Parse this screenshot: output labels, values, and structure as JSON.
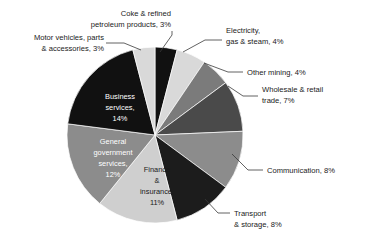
{
  "chart_data": {
    "type": "pie",
    "title": "",
    "subtitle": "",
    "xlabel": "",
    "ylabel": "",
    "legend_position": "none",
    "grid": false,
    "units": "percent",
    "start_angle_deg": 0,
    "direction": "clockwise",
    "categories": [
      "Coke & refined petroleum products",
      "Electricity, gas & steam",
      "Other mining",
      "Wholesale & retail trade",
      "Communication",
      "Transport & storage",
      "Finance & insurance",
      "General government services",
      "Business services",
      "Motor vehicles, parts & accessories"
    ],
    "values": [
      3,
      4,
      4,
      7,
      8,
      8,
      11,
      12,
      14,
      3
    ],
    "colors": [
      "#111111",
      "#d9d9d9",
      "#7b7b7b",
      "#4a4a4a",
      "#8c8c8c",
      "#1c1c1c",
      "#cfcfcf",
      "#8c8c8c",
      "#111111",
      "#d9d9d9"
    ],
    "slices": [
      {
        "name": "coke-refined-petroleum-products",
        "label_line_1": "Coke & refined",
        "label_line_2": "petroleum products, 3%",
        "value": 3,
        "percent_text": "3%",
        "color": "#111111",
        "label_placement": "outside"
      },
      {
        "name": "electricity-gas-steam",
        "label_line_1": "Electricity,",
        "label_line_2": "gas & steam, 4%",
        "value": 4,
        "percent_text": "4%",
        "color": "#d9d9d9",
        "label_placement": "outside"
      },
      {
        "name": "other-mining",
        "label_line_1": "Other mining, 4%",
        "label_line_2": "",
        "value": 4,
        "percent_text": "4%",
        "color": "#7b7b7b",
        "label_placement": "outside"
      },
      {
        "name": "wholesale-retail-trade",
        "label_line_1": "Wholesale & retail",
        "label_line_2": "trade, 7%",
        "value": 7,
        "percent_text": "7%",
        "color": "#4a4a4a",
        "label_placement": "outside"
      },
      {
        "name": "communication",
        "label_line_1": "Communication, 8%",
        "label_line_2": "",
        "value": 8,
        "percent_text": "8%",
        "color": "#8c8c8c",
        "label_placement": "outside"
      },
      {
        "name": "transport-storage",
        "label_line_1": "Transport",
        "label_line_2": "& storage, 8%",
        "value": 8,
        "percent_text": "8%",
        "color": "#1c1c1c",
        "label_placement": "outside"
      },
      {
        "name": "finance-insurance",
        "label_line_1": "Finance",
        "label_line_2": "&",
        "label_line_3": "insurance,",
        "label_line_4": "11%",
        "value": 11,
        "percent_text": "11%",
        "color": "#cfcfcf",
        "label_placement": "inside"
      },
      {
        "name": "general-government-services",
        "label_line_1": "General",
        "label_line_2": "government",
        "label_line_3": "services,",
        "label_line_4": "12%",
        "value": 12,
        "percent_text": "12%",
        "color": "#8c8c8c",
        "label_placement": "inside"
      },
      {
        "name": "business-services",
        "label_line_1": "Business",
        "label_line_2": "services,",
        "label_line_3": "14%",
        "label_line_4": "",
        "value": 14,
        "percent_text": "14%",
        "color": "#111111",
        "label_placement": "inside"
      },
      {
        "name": "motor-vehicles-parts-accessories",
        "label_line_1": "Motor vehicles, parts",
        "label_line_2": "& accessories, 3%",
        "value": 3,
        "percent_text": "3%",
        "color": "#d9d9d9",
        "label_placement": "outside"
      }
    ]
  }
}
